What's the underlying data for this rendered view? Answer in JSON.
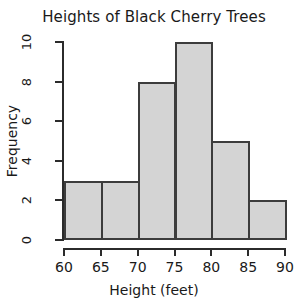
{
  "chart_data": {
    "type": "bar",
    "title": "Heights of Black Cherry Trees",
    "xlabel": "Height (feet)",
    "ylabel": "Frequency",
    "categories": [
      "60-65",
      "65-70",
      "70-75",
      "75-80",
      "80-85",
      "85-90"
    ],
    "bin_edges": [
      60,
      65,
      70,
      75,
      80,
      85,
      90
    ],
    "values": [
      3,
      3,
      8,
      10,
      5,
      2
    ],
    "xlim": [
      60,
      90
    ],
    "ylim": [
      0,
      10
    ],
    "xticks": [
      60,
      65,
      70,
      75,
      80,
      85,
      90
    ],
    "xtick_labels": [
      "60",
      "65",
      "70",
      "75",
      "80",
      "85",
      "90"
    ],
    "yticks": [
      0,
      2,
      4,
      6,
      8,
      10
    ],
    "ytick_labels": [
      "0",
      "2",
      "4",
      "6",
      "8",
      "10"
    ],
    "grid": false,
    "legend": false,
    "bar_fill_color": "#d4d4d4",
    "bar_border_color": "#3c3c3c",
    "axis_color": "#2b2b2b",
    "background_color": "#ffffff"
  }
}
